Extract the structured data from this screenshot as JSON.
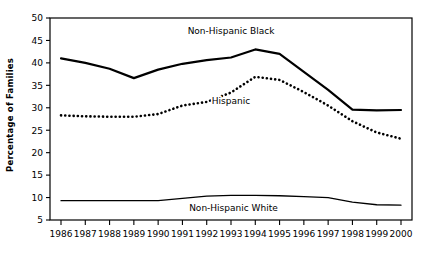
{
  "chart_data": {
    "type": "line",
    "title": "",
    "xlabel": "",
    "ylabel": "Percentage of Families",
    "categories": [
      "1986",
      "1987",
      "1988",
      "1989",
      "1990",
      "1991",
      "1992",
      "1993",
      "1994",
      "1995",
      "1996",
      "1997",
      "1998",
      "1999",
      "2000"
    ],
    "x": [
      1986,
      1987,
      1988,
      1989,
      1990,
      1991,
      1992,
      1993,
      1994,
      1995,
      1996,
      1997,
      1998,
      1999,
      2000
    ],
    "ylim": [
      5,
      50
    ],
    "yticks": [
      5,
      10,
      15,
      20,
      25,
      30,
      35,
      40,
      45,
      50
    ],
    "ytick_labels": [
      "5",
      "10",
      "15",
      "20",
      "25",
      "30",
      "35",
      "40",
      "45",
      "50"
    ],
    "grid": false,
    "legend_position": "inline-annotations",
    "series": [
      {
        "name": "Non-Hispanic Black",
        "style": "solid",
        "color": "#000000",
        "line_width": 2.2,
        "values": [
          41.0,
          40.0,
          38.7,
          36.6,
          38.5,
          39.8,
          40.6,
          41.2,
          43.0,
          42.0,
          38.0,
          34.0,
          29.6,
          29.4,
          29.5
        ],
        "annotation": {
          "label": "Non-Hispanic Black",
          "x": 1993.0,
          "y": 46.4
        }
      },
      {
        "name": "Hispanic",
        "style": "dotted",
        "color": "#000000",
        "line_width": 2.6,
        "values": [
          28.3,
          28.1,
          28.0,
          28.0,
          28.6,
          30.5,
          31.3,
          33.4,
          36.9,
          36.2,
          33.5,
          30.5,
          27.0,
          24.5,
          23.1
        ],
        "annotation": {
          "label": "Hispanic",
          "x": 1993.0,
          "y": 30.8
        }
      },
      {
        "name": "Non-Hispanic White",
        "style": "solid",
        "color": "#000000",
        "line_width": 1.3,
        "values": [
          9.3,
          9.3,
          9.3,
          9.3,
          9.3,
          9.8,
          10.3,
          10.5,
          10.5,
          10.4,
          10.2,
          10.0,
          9.0,
          8.4,
          8.3
        ],
        "annotation": {
          "label": "Non-Hispanic White",
          "x": 1993.1,
          "y": 7.0
        }
      }
    ]
  },
  "axes": {
    "y_axis_title": "Percentage of Families"
  }
}
